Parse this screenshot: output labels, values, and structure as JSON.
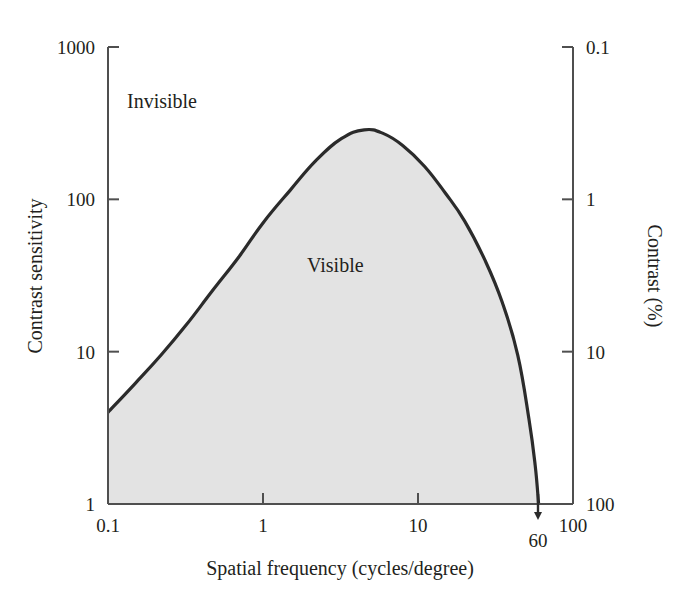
{
  "chart_data": {
    "type": "line",
    "title": "",
    "subtitle": "",
    "xlabel": "Spatial frequency (cycles/degree)",
    "ylabel": "Contrast sensitivity",
    "y2label": "Contrast (%)",
    "xscale": "log",
    "yscale": "log",
    "xlim": [
      0.1,
      100
    ],
    "ylim": [
      1,
      1000
    ],
    "y2lim": [
      100,
      0.1
    ],
    "grid": false,
    "legend": "none",
    "xticks": [
      "0.1",
      "1",
      "10",
      "100"
    ],
    "xtick_values": [
      0.1,
      1,
      10,
      100
    ],
    "yticks": [
      "1",
      "10",
      "100",
      "1000"
    ],
    "ytick_values": [
      1,
      10,
      100,
      1000
    ],
    "y2ticks": [
      "0.1",
      "1",
      "10",
      "100"
    ],
    "y2tick_values": [
      0.1,
      1,
      10,
      100
    ],
    "series": [
      {
        "name": "Contrast sensitivity function",
        "x": [
          0.1,
          0.15,
          0.22,
          0.32,
          0.47,
          0.7,
          1.0,
          1.5,
          2.2,
          3.2,
          4.5,
          6.0,
          8.0,
          11.0,
          15.0,
          20.0,
          27.0,
          35.0,
          44.0,
          52.0,
          57.0,
          60.0
        ],
        "y": [
          4.0,
          6.2,
          9.5,
          15.0,
          25.0,
          42.0,
          70.0,
          115.0,
          180.0,
          250.0,
          286.0,
          270.0,
          225.0,
          165.0,
          110.0,
          72.0,
          40.0,
          21.0,
          9.5,
          3.6,
          1.8,
          1.0
        ]
      }
    ],
    "annotations": [
      {
        "text": "Invisible",
        "x": 0.22,
        "y": 480,
        "name": "invisible-region-label"
      },
      {
        "text": "Visible",
        "x": 2.3,
        "y": 19,
        "name": "visible-region-label"
      },
      {
        "text": "60",
        "x": 60,
        "y": 1,
        "name": "cutoff-frequency-label"
      }
    ],
    "fill_region": {
      "label": "Visible",
      "color": "#e3e3e3",
      "description": "shaded area beneath the contrast sensitivity curve"
    },
    "line_color": "#2b2b2b",
    "background_color": "#ffffff",
    "axis_color": "#4a4a4a"
  },
  "colors": {
    "fill": "#e3e3e3",
    "curve": "#2b2b2b",
    "axis": "#4f4f4f",
    "text": "#231f20",
    "background": "#ffffff"
  }
}
